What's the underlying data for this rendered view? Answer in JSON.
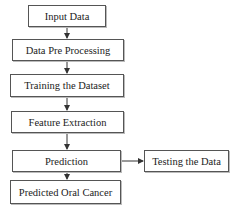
{
  "diagram": {
    "type": "flowchart",
    "nodes": [
      {
        "id": "input",
        "label": "Input Data"
      },
      {
        "id": "preprocess",
        "label": "Data Pre Processing"
      },
      {
        "id": "training",
        "label": "Training the Dataset"
      },
      {
        "id": "feature",
        "label": "Feature Extraction"
      },
      {
        "id": "prediction",
        "label": "Prediction"
      },
      {
        "id": "testing",
        "label": "Testing the Data"
      },
      {
        "id": "output",
        "label": "Predicted Oral Cancer"
      }
    ],
    "edges": [
      {
        "from": "input",
        "to": "preprocess"
      },
      {
        "from": "preprocess",
        "to": "training"
      },
      {
        "from": "training",
        "to": "feature"
      },
      {
        "from": "feature",
        "to": "prediction"
      },
      {
        "from": "prediction",
        "to": "testing"
      },
      {
        "from": "prediction",
        "to": "output"
      }
    ],
    "colors": {
      "stroke": "#555555",
      "text": "#222222",
      "background": "#ffffff"
    }
  }
}
